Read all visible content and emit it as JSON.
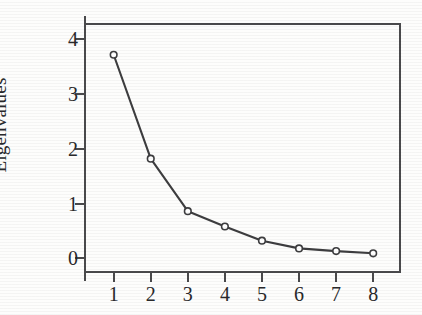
{
  "chart_data": {
    "type": "line",
    "title": "",
    "subtitle": "",
    "xlabel": "",
    "ylabel": "Eigenvalues",
    "categories": [
      "1",
      "2",
      "3",
      "4",
      "5",
      "6",
      "7",
      "8"
    ],
    "x": [
      1,
      2,
      3,
      4,
      5,
      6,
      7,
      8
    ],
    "values": [
      3.72,
      1.82,
      0.86,
      0.58,
      0.32,
      0.18,
      0.13,
      0.09
    ],
    "series": [
      {
        "name": "Eigenvalues",
        "values": [
          3.72,
          1.82,
          0.86,
          0.58,
          0.32,
          0.18,
          0.13,
          0.09
        ]
      }
    ],
    "xlim": [
      0.2,
      8.75
    ],
    "ylim": [
      -0.27,
      4.3
    ],
    "ytick_labels": [
      "0",
      "1",
      "2",
      "3",
      "4"
    ],
    "ytick_values": [
      0,
      1,
      2,
      3,
      4
    ],
    "xtick_labels": [
      "1",
      "2",
      "3",
      "4",
      "5",
      "6",
      "7",
      "8"
    ],
    "xtick_values": [
      1,
      2,
      3,
      4,
      5,
      6,
      7,
      8
    ],
    "grid": false,
    "legend": false,
    "legend_position": "none",
    "marker": "open-circle",
    "line_color": "#3d3d3f",
    "marker_fill": "#ffffff",
    "marker_edge_color": "#3d3d3f",
    "axis_color": "#4a4a4c",
    "background_color": "#fdfdfc",
    "text_color": "#29292b"
  }
}
